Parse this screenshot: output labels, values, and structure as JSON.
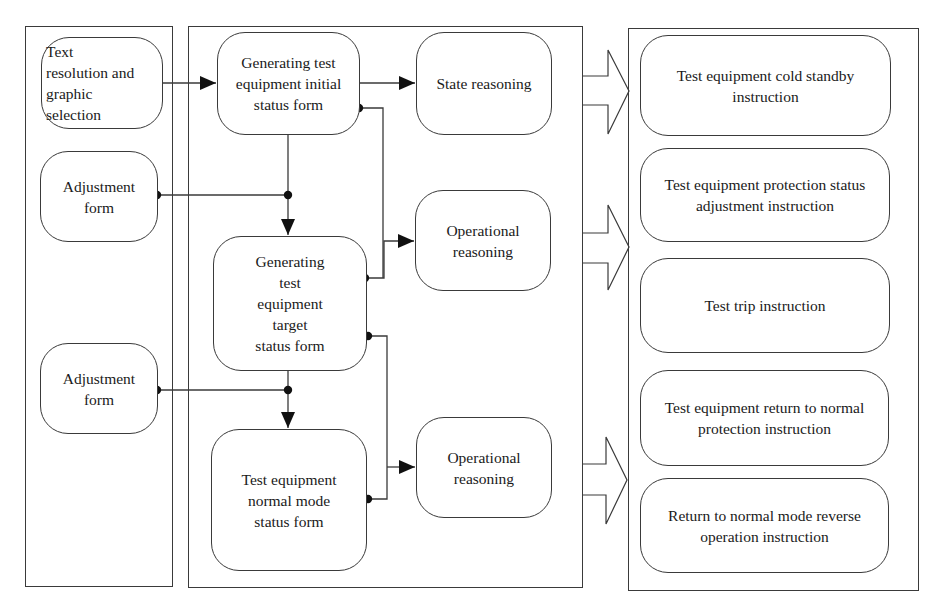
{
  "diagram": {
    "colors": {
      "stroke": "#3a3a3a",
      "text": "#1a1a1a",
      "background": "#ffffff"
    },
    "frames": [
      {
        "id": "input-column",
        "x": 25,
        "y": 26,
        "w": 148,
        "h": 561
      },
      {
        "id": "generation-column",
        "x": 188,
        "y": 26,
        "w": 395,
        "h": 562
      },
      {
        "id": "instruction-column",
        "x": 628,
        "y": 28,
        "w": 291,
        "h": 563
      }
    ],
    "nodes": {
      "text_resolution": {
        "label": "Text\nresolution and\ngraphic\nselection",
        "x": 41,
        "y": 37,
        "w": 122,
        "h": 92
      },
      "adjustment_form_1": {
        "label": "Adjustment\nform",
        "x": 40,
        "y": 151,
        "w": 118,
        "h": 91
      },
      "adjustment_form_2": {
        "label": "Adjustment\nform",
        "x": 40,
        "y": 343,
        "w": 118,
        "h": 91
      },
      "initial_status_form": {
        "label": "Generating test\nequipment initial\nstatus form",
        "x": 217,
        "y": 32,
        "w": 143,
        "h": 103
      },
      "target_status_form": {
        "label": "Generating\ntest\nequipment\ntarget\nstatus form",
        "x": 213,
        "y": 236,
        "w": 154,
        "h": 135
      },
      "normal_mode_status_form": {
        "label": "Test equipment\nnormal mode\nstatus form",
        "x": 211,
        "y": 429,
        "w": 156,
        "h": 142
      },
      "state_reasoning": {
        "label": "State reasoning",
        "x": 416,
        "y": 32,
        "w": 136,
        "h": 103
      },
      "operational_reasoning_1": {
        "label": "Operational\nreasoning",
        "x": 415,
        "y": 190,
        "w": 136,
        "h": 101
      },
      "operational_reasoning_2": {
        "label": "Operational\nreasoning",
        "x": 416,
        "y": 417,
        "w": 136,
        "h": 101
      },
      "cold_standby_instruction": {
        "label": "Test equipment cold standby\ninstruction",
        "x": 640,
        "y": 35,
        "w": 251,
        "h": 101
      },
      "protection_adjustment_instruction": {
        "label": "Test equipment protection status\nadjustment instruction",
        "x": 640,
        "y": 148,
        "w": 250,
        "h": 94
      },
      "trip_instruction": {
        "label": "Test trip instruction",
        "x": 640,
        "y": 258,
        "w": 250,
        "h": 95
      },
      "return_protection_instruction": {
        "label": "Test equipment return to normal\nprotection instruction",
        "x": 640,
        "y": 370,
        "w": 249,
        "h": 96
      },
      "reverse_operation_instruction": {
        "label": "Return to normal mode reverse\noperation instruction",
        "x": 640,
        "y": 478,
        "w": 249,
        "h": 95
      }
    },
    "edges": [
      {
        "from": "text_resolution",
        "to": "initial_status_form",
        "points": [
          [
            163,
            83
          ],
          [
            216,
            83
          ]
        ],
        "arrow": "end"
      },
      {
        "from": "initial_status_form",
        "to": "state_reasoning",
        "points": [
          [
            360,
            83
          ],
          [
            415,
            83
          ]
        ],
        "arrow": "end"
      },
      {
        "from": "initial_status_form",
        "to": "target_status_form",
        "points": [
          [
            288,
            135
          ],
          [
            288,
            235
          ]
        ],
        "arrow": "end"
      },
      {
        "from": "adjustment_form_1",
        "to": "target_status_form",
        "points": [
          [
            157,
            195
          ],
          [
            288,
            195
          ]
        ],
        "arrow": "none",
        "dots": [
          [
            157,
            195
          ],
          [
            288,
            195
          ]
        ]
      },
      {
        "from": "initial_status_form",
        "to": "operational_reasoning_1",
        "points": [
          [
            359,
            108
          ],
          [
            383,
            108
          ],
          [
            383,
            278
          ]
        ],
        "arrow": "none",
        "dots": [
          [
            359,
            108
          ]
        ]
      },
      {
        "from": "target_status_form",
        "to": "operational_reasoning_1",
        "points": [
          [
            365,
            278
          ],
          [
            384,
            278
          ],
          [
            384,
            241
          ],
          [
            414,
            241
          ]
        ],
        "arrow": "end",
        "dots": [
          [
            365,
            278
          ]
        ]
      },
      {
        "from": "target_status_form",
        "to": "normal_mode_status_form",
        "points": [
          [
            288,
            371
          ],
          [
            288,
            428
          ]
        ],
        "arrow": "end"
      },
      {
        "from": "adjustment_form_2",
        "to": "normal_mode_status_form",
        "points": [
          [
            157,
            390
          ],
          [
            288,
            390
          ]
        ],
        "arrow": "none",
        "dots": [
          [
            157,
            390
          ],
          [
            288,
            390
          ]
        ]
      },
      {
        "from": "target_status_form",
        "to": "operational_reasoning_2",
        "points": [
          [
            368,
            336
          ],
          [
            387,
            336
          ],
          [
            387,
            499
          ],
          [
            368,
            499
          ]
        ],
        "arrow": "none",
        "dots": [
          [
            368,
            336
          ],
          [
            368,
            499
          ]
        ]
      },
      {
        "from": "normal_mode_status_form",
        "to": "operational_reasoning_2",
        "points": [
          [
            387,
            467
          ],
          [
            415,
            467
          ]
        ],
        "arrow": "end"
      }
    ],
    "block_arrows": [
      {
        "id": "to-instructions-1",
        "shaft_x0": 583,
        "shaft_x1": 608,
        "tip_x": 629,
        "head_top": 50,
        "shaft_top": 76,
        "tip_y": 91,
        "shaft_bottom": 105,
        "head_bottom": 134
      },
      {
        "id": "to-instructions-2",
        "shaft_x0": 583,
        "shaft_x1": 608,
        "tip_x": 629,
        "head_top": 205,
        "shaft_top": 233,
        "tip_y": 247,
        "shaft_bottom": 263,
        "head_bottom": 290
      },
      {
        "id": "to-instructions-3",
        "shaft_x0": 583,
        "shaft_x1": 606,
        "tip_x": 627,
        "head_top": 437,
        "shaft_top": 464,
        "tip_y": 480,
        "shaft_bottom": 495,
        "head_bottom": 524
      }
    ]
  }
}
